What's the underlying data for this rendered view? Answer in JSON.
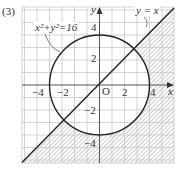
{
  "problem_number": "(3)",
  "axes": {
    "x_label": "x",
    "y_label": "y",
    "origin_label": "O",
    "x_ticks": [
      {
        "value": -4,
        "label": "−4"
      },
      {
        "value": -2,
        "label": "−2"
      },
      {
        "value": 2,
        "label": "2"
      },
      {
        "value": 4,
        "label": "4"
      }
    ],
    "y_ticks": [
      {
        "value": 4,
        "label": "4"
      },
      {
        "value": 2,
        "label": "2"
      },
      {
        "value": -2,
        "label": "−2"
      },
      {
        "value": -4,
        "label": "−4"
      }
    ]
  },
  "curves": {
    "circle_label": "x²+y²=16",
    "line_label": "y = x"
  },
  "shaded_region": "outside circle x²+y²=16 and below line y=x",
  "colors": {
    "grid": "#c8c8c8",
    "axis": "#555555",
    "curve": "#222222",
    "hatch": "#9a9a9a"
  }
}
